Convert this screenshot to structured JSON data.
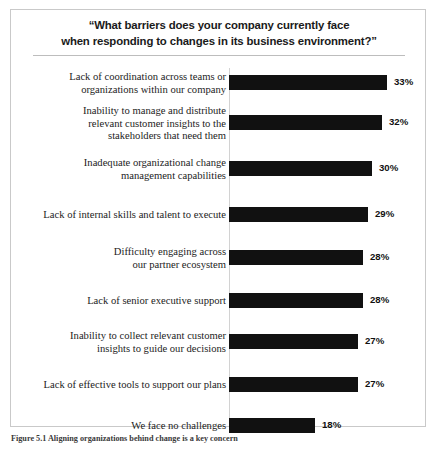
{
  "figure": {
    "caption": "Figure 5.1 Aligning organizations behind change is a key concern",
    "border_color": "#c9c9c9"
  },
  "chart_data": {
    "type": "bar",
    "orientation": "horizontal",
    "title": "“What barriers does your company currently face when responding to changes in its business environment?”",
    "title_line1": "“What barriers does your company currently face",
    "title_line2": "when responding to changes in its business environment?”",
    "xlabel": "",
    "ylabel": "",
    "xlim": [
      0,
      36
    ],
    "grid": false,
    "legend": false,
    "bar_color": "#111111",
    "value_suffix": "%",
    "categories": [
      "Lack of coordination across teams or organizations within our company",
      "Inability to manage and distribute relevant customer insights to the stakeholders that need them",
      "Inadequate organizational change management capabilities",
      "Lack of internal skills and talent to execute",
      "Difficulty engaging across our partner ecosystem",
      "Lack of senior executive support",
      "Inability to collect relevant customer insights to guide our decisions",
      "Lack of effective tools to support our plans",
      "We face no challenges"
    ],
    "values": [
      33,
      32,
      30,
      29,
      28,
      28,
      27,
      27,
      18
    ],
    "value_labels": [
      "33%",
      "32%",
      "30%",
      "29%",
      "28%",
      "28%",
      "27%",
      "27%",
      "18%"
    ],
    "category_lines": [
      [
        "Lack of coordination across teams or",
        "organizations within our company"
      ],
      [
        "Inability to manage and distribute",
        "relevant customer insights to the",
        "stakeholders that need them"
      ],
      [
        "Inadequate organizational change",
        "management capabilities"
      ],
      [
        "Lack of internal skills and talent to execute"
      ],
      [
        "Difficulty engaging across",
        "our partner ecosystem"
      ],
      [
        "Lack of senior executive support"
      ],
      [
        "Inability to collect relevant customer",
        "insights to guide our decisions"
      ],
      [
        "Lack of effective tools to support our plans"
      ],
      [
        "We face no challenges"
      ]
    ]
  }
}
